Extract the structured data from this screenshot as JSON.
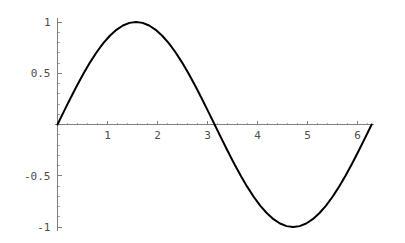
{
  "chart_data": {
    "type": "line",
    "title": "",
    "subtitle": "",
    "xlabel": "",
    "ylabel": "",
    "xlim": [
      0,
      6.2832
    ],
    "ylim": [
      -1.05,
      1.05
    ],
    "grid": false,
    "legend": null,
    "function": "sin(x)",
    "x_ticks": [
      1,
      2,
      3,
      4,
      5,
      6
    ],
    "x_tick_labels": [
      "1",
      "2",
      "3",
      "4",
      "5",
      "6"
    ],
    "y_ticks": [
      1,
      0.5,
      -0.5,
      -1
    ],
    "y_tick_labels": [
      "1",
      "0.5",
      "-0.5",
      "-1"
    ],
    "x_minor_tick_step": 0.2,
    "y_minor_tick_step": 0.1,
    "series": [
      {
        "name": "sin(x)",
        "color": "#000000",
        "x": [
          0.0,
          0.1309,
          0.2618,
          0.3927,
          0.5236,
          0.6545,
          0.7854,
          0.9163,
          1.0472,
          1.1781,
          1.309,
          1.4399,
          1.5708,
          1.7017,
          1.8326,
          1.9635,
          2.0944,
          2.2253,
          2.3562,
          2.4871,
          2.618,
          2.7489,
          2.8798,
          3.0107,
          3.1416,
          3.2725,
          3.4034,
          3.5343,
          3.6652,
          3.7961,
          3.927,
          4.0579,
          4.1888,
          4.3197,
          4.4506,
          4.5815,
          4.7124,
          4.8433,
          4.9742,
          5.1051,
          5.236,
          5.3669,
          5.4978,
          5.6287,
          5.7596,
          5.8905,
          6.0214,
          6.1523,
          6.2832
        ],
        "y": [
          0.0,
          0.1305,
          0.2588,
          0.3827,
          0.5,
          0.6088,
          0.7071,
          0.7934,
          0.866,
          0.9239,
          0.9659,
          0.9914,
          1.0,
          0.9914,
          0.9659,
          0.9239,
          0.866,
          0.7934,
          0.7071,
          0.6088,
          0.5,
          0.3827,
          0.2588,
          0.1305,
          0.0,
          -0.1305,
          -0.2588,
          -0.3827,
          -0.5,
          -0.6088,
          -0.7071,
          -0.7934,
          -0.866,
          -0.9239,
          -0.9659,
          -0.9914,
          -1.0,
          -0.9914,
          -0.9659,
          -0.9239,
          -0.866,
          -0.7934,
          -0.7071,
          -0.6088,
          -0.5,
          -0.3827,
          -0.2588,
          -0.1305,
          0.0
        ]
      }
    ],
    "annotations": [],
    "colors": {
      "curve": "#000000",
      "axis": "#808080",
      "minor_tick": "#a8a8a8",
      "tick_label": "#4d4d4d",
      "background": "#ffffff"
    }
  }
}
